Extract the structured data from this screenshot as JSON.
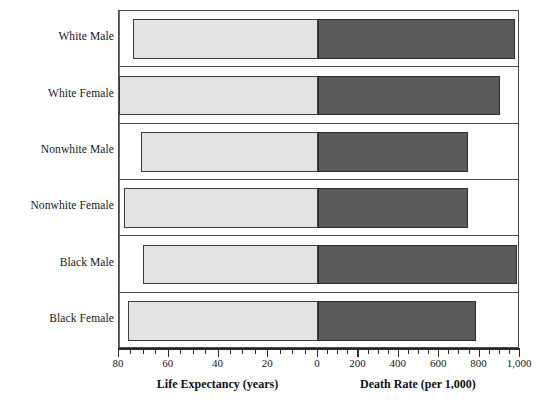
{
  "chart_data": {
    "type": "bar",
    "subtype": "bidirectional-population-pyramid",
    "title": "",
    "categories": [
      "White Male",
      "White Female",
      "Nonwhite Male",
      "Nonwhite Female",
      "Black Male",
      "Black Female"
    ],
    "series": [
      {
        "name": "Life Expectancy (years)",
        "direction": "left",
        "unit": "years",
        "values": [
          74.4,
          80.0,
          71.2,
          77.8,
          70.3,
          76.4
        ],
        "axis": {
          "label": "Life Expectancy (years)",
          "range": [
            80,
            0
          ],
          "reversed": true,
          "major_ticks": [
            80,
            60,
            40,
            20,
            0
          ],
          "minor_tick_step": 5,
          "tick_labels": [
            "80",
            "60",
            "40",
            "20",
            "0"
          ]
        },
        "color": "#e3e3e3",
        "border_color": "#3d3d3d"
      },
      {
        "name": "Death Rate (per 1,000)",
        "direction": "right",
        "unit": "per 1,000",
        "values": [
          975,
          900,
          745,
          745,
          985,
          780
        ],
        "axis": {
          "label": "Death Rate (per 1,000)",
          "range": [
            0,
            1000
          ],
          "reversed": false,
          "major_ticks": [
            0,
            200,
            400,
            600,
            800,
            1000
          ],
          "minor_tick_step": 50,
          "tick_labels": [
            "0",
            "200",
            "400",
            "600",
            "800",
            "1,000"
          ]
        },
        "color": "#5a5a5a",
        "border_color": "#2f2f2f"
      }
    ],
    "grid": false,
    "legend": "none",
    "xlabel_left": "Life Expectancy (years)",
    "xlabel_right": "Death Rate (per 1,000)",
    "ylabel": ""
  },
  "axis_left": {
    "title": "Life Expectancy (years)",
    "ticks": [
      {
        "value": 80,
        "label": "80",
        "major": true
      },
      {
        "value": 75,
        "label": "",
        "major": false
      },
      {
        "value": 70,
        "label": "",
        "major": false
      },
      {
        "value": 65,
        "label": "",
        "major": false
      },
      {
        "value": 60,
        "label": "60",
        "major": true
      },
      {
        "value": 55,
        "label": "",
        "major": false
      },
      {
        "value": 50,
        "label": "",
        "major": false
      },
      {
        "value": 45,
        "label": "",
        "major": false
      },
      {
        "value": 40,
        "label": "40",
        "major": true
      },
      {
        "value": 35,
        "label": "",
        "major": false
      },
      {
        "value": 30,
        "label": "",
        "major": false
      },
      {
        "value": 25,
        "label": "",
        "major": false
      },
      {
        "value": 20,
        "label": "20",
        "major": true
      },
      {
        "value": 15,
        "label": "",
        "major": false
      },
      {
        "value": 10,
        "label": "",
        "major": false
      },
      {
        "value": 5,
        "label": "",
        "major": false
      },
      {
        "value": 0,
        "label": "0",
        "major": true
      }
    ]
  },
  "axis_right": {
    "title": "Death Rate (per 1,000)",
    "ticks": [
      {
        "value": 50,
        "label": "",
        "major": false
      },
      {
        "value": 100,
        "label": "",
        "major": false
      },
      {
        "value": 150,
        "label": "",
        "major": false
      },
      {
        "value": 200,
        "label": "200",
        "major": true
      },
      {
        "value": 250,
        "label": "",
        "major": false
      },
      {
        "value": 300,
        "label": "",
        "major": false
      },
      {
        "value": 350,
        "label": "",
        "major": false
      },
      {
        "value": 400,
        "label": "400",
        "major": true
      },
      {
        "value": 450,
        "label": "",
        "major": false
      },
      {
        "value": 500,
        "label": "",
        "major": false
      },
      {
        "value": 550,
        "label": "",
        "major": false
      },
      {
        "value": 600,
        "label": "600",
        "major": true
      },
      {
        "value": 650,
        "label": "",
        "major": false
      },
      {
        "value": 700,
        "label": "",
        "major": false
      },
      {
        "value": 750,
        "label": "",
        "major": false
      },
      {
        "value": 800,
        "label": "800",
        "major": true
      },
      {
        "value": 850,
        "label": "",
        "major": false
      },
      {
        "value": 900,
        "label": "",
        "major": false
      },
      {
        "value": 950,
        "label": "",
        "major": false
      },
      {
        "value": 1000,
        "label": "1,000",
        "major": true
      }
    ]
  },
  "colors": {
    "life_expectancy_fill": "#e3e3e3",
    "death_rate_fill": "#5a5a5a",
    "frame": "#4a4a4a",
    "axis": "#2b2b2b",
    "text": "#171717"
  }
}
